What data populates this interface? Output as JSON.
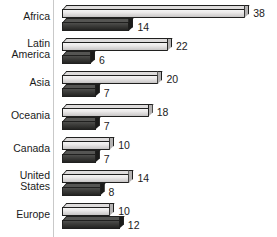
{
  "chart_data": {
    "type": "bar",
    "orientation": "horizontal",
    "title": "",
    "subtitle": "",
    "xlabel": "",
    "ylabel": "",
    "grid": false,
    "legend": "none",
    "axis_line": "vertical baseline at left of bars",
    "xlim": [
      0,
      38
    ],
    "categories": [
      "Africa",
      "Latin\nAmerica",
      "Asia",
      "Oceania",
      "Canada",
      "United\nStates",
      "Europe"
    ],
    "series": [
      {
        "name": "series-light",
        "color": "#e8e6e6",
        "values": [
          38,
          22,
          20,
          18,
          10,
          14,
          10
        ]
      },
      {
        "name": "series-dark",
        "color": "#3a3a38",
        "values": [
          14,
          6,
          7,
          7,
          7,
          8,
          12
        ]
      }
    ],
    "rows": [
      {
        "label": "Africa",
        "lines": 1,
        "light": 38,
        "dark": 14
      },
      {
        "label": "Latin\nAmerica",
        "lines": 2,
        "light": 22,
        "dark": 6
      },
      {
        "label": "Asia",
        "lines": 1,
        "light": 20,
        "dark": 7
      },
      {
        "label": "Oceania",
        "lines": 1,
        "light": 18,
        "dark": 7
      },
      {
        "label": "Canada",
        "lines": 1,
        "light": 10,
        "dark": 7
      },
      {
        "label": "United\nStates",
        "lines": 2,
        "light": 14,
        "dark": 8
      },
      {
        "label": "Europe",
        "lines": 1,
        "light": 10,
        "dark": 12
      }
    ],
    "value_labels": {
      "light": [
        "38",
        "22",
        "20",
        "18",
        "10",
        "14",
        "10"
      ],
      "dark": [
        "14",
        "6",
        "7",
        "7",
        "7",
        "8",
        "12"
      ]
    }
  },
  "colors": {
    "light_bar": "#e8e6e6",
    "dark_bar": "#3a3a38",
    "outline": "#20201f",
    "axis": "#c9c9c9",
    "text": "#1a1a1a",
    "background": "#ffffff"
  }
}
